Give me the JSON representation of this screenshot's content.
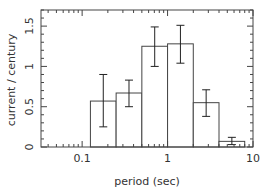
{
  "chart_data": {
    "type": "bar",
    "title": "",
    "xlabel": "period (sec)",
    "ylabel": "current / century",
    "xscale": "log",
    "xlim": [
      0.033,
      10
    ],
    "ylim": [
      0,
      1.7
    ],
    "grid": false,
    "legend": null,
    "x_tick_labels": [
      "0.1",
      "1",
      "10"
    ],
    "x_ticks": [
      0.1,
      1,
      10
    ],
    "y_tick_labels": [
      "0",
      "0.5",
      "1",
      "1.5"
    ],
    "y_ticks": [
      0,
      0.5,
      1,
      1.5
    ],
    "bins": [
      {
        "left": 0.125,
        "right": 0.25,
        "value": 0.57,
        "err_low": 0.25,
        "err_high": 0.9
      },
      {
        "left": 0.25,
        "right": 0.5,
        "value": 0.67,
        "err_low": 0.5,
        "err_high": 0.83
      },
      {
        "left": 0.5,
        "right": 1,
        "value": 1.25,
        "err_low": 1.0,
        "err_high": 1.49
      },
      {
        "left": 1,
        "right": 2,
        "value": 1.28,
        "err_low": 1.04,
        "err_high": 1.51
      },
      {
        "left": 2,
        "right": 4,
        "value": 0.55,
        "err_low": 0.38,
        "err_high": 0.71
      },
      {
        "left": 4,
        "right": 8,
        "value": 0.07,
        "err_low": 0.03,
        "err_high": 0.12
      }
    ]
  }
}
